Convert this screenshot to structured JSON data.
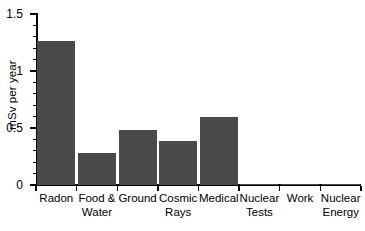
{
  "chart_data": {
    "type": "bar",
    "title": "",
    "xlabel": "",
    "ylabel": "mSv per year",
    "categories": [
      "Radon",
      "Food &\nWater",
      "Ground",
      "Cosmic\nRays",
      "Medical",
      "Nuclear\nTests",
      "Work",
      "Nuclear\nEnergy"
    ],
    "values": [
      1.26,
      0.285,
      0.48,
      0.39,
      0.6,
      0.005,
      0.005,
      0.004
    ],
    "ylim": [
      0,
      1.5
    ],
    "ytick_labels": [
      "0",
      "0.5",
      "1",
      "1.5"
    ],
    "ytick_values": [
      0,
      0.5,
      1,
      1.5
    ],
    "yminor_step": 0.1,
    "grid": false,
    "legend": null,
    "bar_color": "#4a4a4a",
    "axis_color": "#000000",
    "background_color": "#ffffff"
  }
}
